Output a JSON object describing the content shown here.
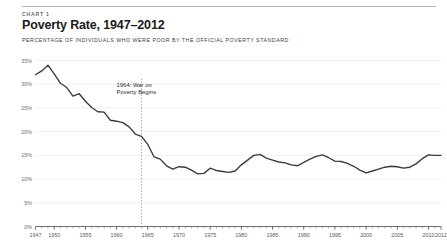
{
  "header": {
    "kicker": "CHART 1",
    "title": "Poverty Rate, 1947–2012",
    "subtitle": "PERCENTAGE OF INDIVIDUALS WHO WERE POOR BY THE OFFICIAL POVERTY STANDARD"
  },
  "colors": {
    "line": "#3b3b3b",
    "grid": "#e3e3e3",
    "axis": "#4a4a4a",
    "event_line": "#8c8c8c",
    "rule": "#b8b8b8",
    "title_text": "#1a1a1a",
    "muted_text": "#6a6a6a"
  },
  "annotations": [
    {
      "name": "war-on-poverty",
      "line1": "1964: War on",
      "line2": "Poverty Begins",
      "year": 1964
    }
  ],
  "chart_data": {
    "type": "line",
    "title": "Poverty Rate, 1947–2012",
    "subtitle": "PERCENTAGE OF INDIVIDUALS WHO WERE POOR BY THE OFFICIAL POVERTY STANDARD",
    "xlabel": "",
    "ylabel": "",
    "xlim": [
      1947,
      2012
    ],
    "ylim": [
      0,
      35
    ],
    "grid": true,
    "legend": "none",
    "ytick_labels": [
      "0%",
      "5%",
      "10%",
      "15%",
      "20%",
      "25%",
      "30%",
      "35%"
    ],
    "ytick_values": [
      0,
      5,
      10,
      15,
      20,
      25,
      30,
      35
    ],
    "xtick_labels": [
      "1947",
      "1950",
      "1955",
      "1960",
      "1965",
      "1970",
      "1975",
      "1980",
      "1985",
      "1990",
      "1995",
      "2000",
      "2005",
      "2010",
      "2012"
    ],
    "xtick_values": [
      1947,
      1950,
      1955,
      1960,
      1965,
      1970,
      1975,
      1980,
      1985,
      1990,
      1995,
      2000,
      2005,
      2010,
      2012
    ],
    "xminor_step": 1,
    "series": [
      {
        "name": "Poverty Rate",
        "x": [
          1947,
          1948,
          1949,
          1950,
          1951,
          1952,
          1953,
          1954,
          1955,
          1956,
          1957,
          1958,
          1959,
          1960,
          1961,
          1962,
          1963,
          1964,
          1965,
          1966,
          1967,
          1968,
          1969,
          1970,
          1971,
          1972,
          1973,
          1974,
          1975,
          1976,
          1977,
          1978,
          1979,
          1980,
          1981,
          1982,
          1983,
          1984,
          1985,
          1986,
          1987,
          1988,
          1989,
          1990,
          1991,
          1992,
          1993,
          1994,
          1995,
          1996,
          1997,
          1998,
          1999,
          2000,
          2001,
          2002,
          2003,
          2004,
          2005,
          2006,
          2007,
          2008,
          2009,
          2010,
          2011,
          2012
        ],
        "y": [
          32.0,
          32.8,
          34.0,
          32.2,
          30.2,
          29.3,
          27.5,
          28.0,
          26.4,
          25.1,
          24.2,
          24.1,
          22.4,
          22.2,
          21.9,
          21.0,
          19.5,
          19.0,
          17.3,
          14.7,
          14.2,
          12.8,
          12.1,
          12.6,
          12.5,
          11.9,
          11.1,
          11.2,
          12.3,
          11.8,
          11.6,
          11.4,
          11.7,
          13.0,
          14.0,
          15.0,
          15.2,
          14.4,
          14.0,
          13.6,
          13.4,
          13.0,
          12.8,
          13.5,
          14.2,
          14.8,
          15.1,
          14.5,
          13.8,
          13.7,
          13.3,
          12.7,
          11.9,
          11.3,
          11.7,
          12.1,
          12.5,
          12.7,
          12.6,
          12.3,
          12.5,
          13.2,
          14.3,
          15.1,
          15.0,
          15.0
        ]
      }
    ]
  }
}
